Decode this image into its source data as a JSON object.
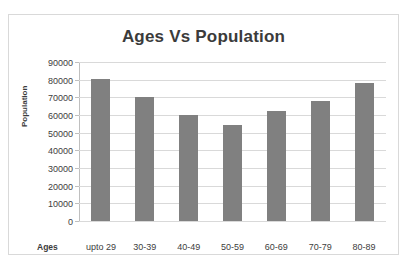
{
  "chart_data": {
    "type": "bar",
    "title": "Ages Vs Population",
    "xlabel": "Ages",
    "ylabel": "Population",
    "categories": [
      "upto 29",
      "30-39",
      "40-49",
      "50-59",
      "60-69",
      "70-79",
      "80-89"
    ],
    "values": [
      80500,
      70000,
      60000,
      54500,
      62000,
      68000,
      78000
    ],
    "ylim": [
      0,
      90000
    ],
    "y_ticks": [
      0,
      10000,
      20000,
      30000,
      40000,
      50000,
      60000,
      70000,
      80000,
      90000
    ],
    "y_tick_labels": [
      "0",
      "10000",
      "20000",
      "30000",
      "40000",
      "50000",
      "60000",
      "70000",
      "80000",
      "90000"
    ],
    "grid": true,
    "legend": false,
    "series": [
      {
        "name": "Population",
        "values": [
          80500,
          70000,
          60000,
          54500,
          62000,
          68000,
          78000
        ]
      }
    ],
    "colors": {
      "bar_fill": "#808080",
      "gridline": "#d9d9d9",
      "axis_line": "#bfbfbf",
      "text": "#404040",
      "title_text": "#3b3b3b",
      "frame_border": "#d9d9d9",
      "background": "#ffffff"
    }
  }
}
